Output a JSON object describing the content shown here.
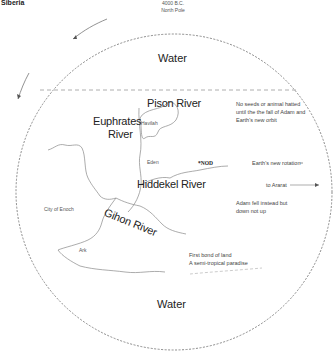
{
  "corner_label": "Siberia",
  "top": {
    "date": "4000 B.C.",
    "pole": "North Pole"
  },
  "water_top": "Water",
  "water_bottom": "Water",
  "rivers": {
    "pison": "Pison River",
    "euphrates_line1": "Euphrates",
    "euphrates_line2": "River",
    "hiddekel": "Hiddekel River",
    "gihon": "Gihon River"
  },
  "places": {
    "havilah": "Havilah",
    "eden": "Eden",
    "nod": "*NOD",
    "city_of_enoch": "City of Enoch",
    "ark": "Ark"
  },
  "notes": {
    "no_seeds_line1": "No seeds or animal hatted",
    "no_seeds_line2": "until the the fall of Adam and",
    "no_seeds_line3": "Earth's new orbit",
    "new_rotation": "Earth's new rotation",
    "to_ararat": "to Ararat",
    "adam_line1": "Adam fell instead but",
    "adam_line2": "down not up",
    "first_land_line1": "First bond of land",
    "first_land_line2": "A semi-tropical paradise"
  },
  "colors": {
    "line": "#8a8a8a",
    "text": "#222222",
    "background": "#ffffff"
  }
}
